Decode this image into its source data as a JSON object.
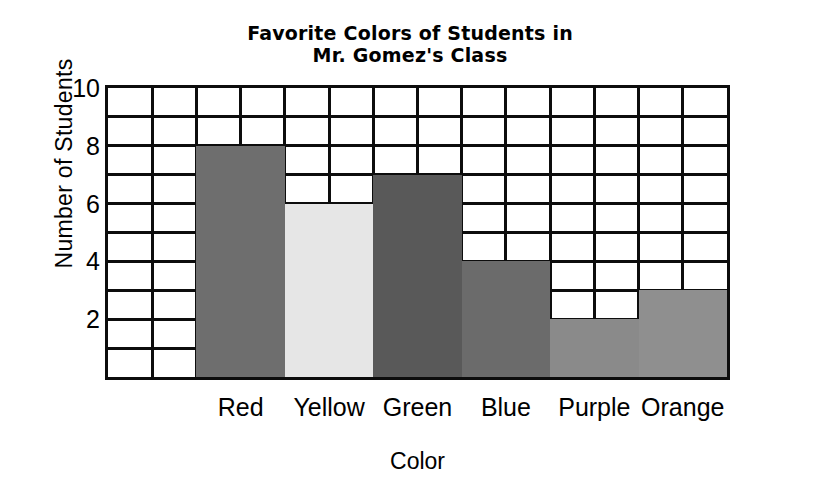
{
  "chart_data": {
    "type": "bar",
    "title": "Favorite Colors of Students in Mr. Gomez's Class",
    "title_lines": [
      "Favorite Colors of Students in",
      "Mr. Gomez's Class"
    ],
    "xlabel": "Color",
    "ylabel": "Number of Students",
    "categories": [
      "Red",
      "Yellow",
      "Green",
      "Blue",
      "Purple",
      "Orange"
    ],
    "values": [
      8,
      6,
      7,
      4,
      2,
      3
    ],
    "ylim": [
      0,
      10
    ],
    "ytick_labels": [
      "2",
      "4",
      "6",
      "8",
      "10"
    ],
    "ytick_values": [
      2,
      4,
      6,
      8,
      10
    ],
    "ymajor_step": 2,
    "yminor_step": 1,
    "grid": true,
    "legend": false,
    "bar_colors": [
      "#6e6e6e",
      "#e6e6e6",
      "#595959",
      "#6b6b6b",
      "#8a8a8a",
      "#8f8f8f"
    ],
    "grid_line_color": "#0d0d0d",
    "plot_background": "#ffffff",
    "bars": [
      {
        "category": "Red",
        "value": 8,
        "color": "#6e6e6e"
      },
      {
        "category": "Yellow",
        "value": 6,
        "color": "#e6e6e6"
      },
      {
        "category": "Green",
        "value": 7,
        "color": "#595959"
      },
      {
        "category": "Blue",
        "value": 4,
        "color": "#6b6b6b"
      },
      {
        "category": "Purple",
        "value": 2,
        "color": "#8a8a8a"
      },
      {
        "category": "Orange",
        "value": 3,
        "color": "#8f8f8f"
      }
    ]
  }
}
